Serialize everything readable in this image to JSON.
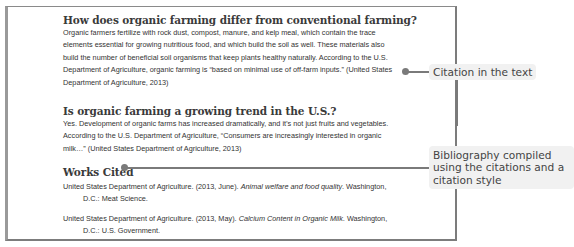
{
  "document": {
    "sections": [
      {
        "heading": "How does organic farming differ from conventional farming?",
        "lines": [
          "Organic farmers fertilize with rock dust, compost, manure, and kelp meal, which contain the trace",
          "elements essential for growing nutritious food, and which build the soil as well. These materials also",
          "build the number of beneficial soil organisms that keep plants healthy naturally. According  to the U.S.",
          "Department of Agriculture, organic farming is “based on minimal use of off-farm inputs.” (United States",
          "Department of Agriculture, 2013)"
        ]
      },
      {
        "heading": "Is organic farming a growing trend in the U.S.?",
        "lines": [
          "Yes. Development  of organic farms has increased dramatically, and it’s not just fruits and vegetables.",
          "According to the U.S. Department  of Agriculture, “Consumers are increasingly interested in organic",
          "milk…” (United States Department of Agriculture, 2013)"
        ]
      }
    ],
    "works_cited": {
      "heading": "Works Cited",
      "entries": [
        {
          "prefix": "United States Department of Agriculture. (2013, June). ",
          "title": "Animal welfare and food quality",
          "suffix": ". Washington,",
          "continuation": "D.C.: Meat Science."
        },
        {
          "prefix": "United States Department of Agriculture. (2013, May). ",
          "title": "Calcium Content in Organic Milk",
          "suffix": ". Washington,",
          "continuation": "D.C.: U.S. Government."
        }
      ]
    }
  },
  "callouts": {
    "citation": {
      "label": "Citation in the text"
    },
    "bibliography": {
      "lines": [
        "Bibliography compiled",
        "using the citations and a",
        "citation style"
      ]
    }
  },
  "colors": {
    "connector": "#7a7a7a",
    "callout_bg": "#f1f1f1",
    "heading_text": "#3a3a3a",
    "body_text": "#333333"
  }
}
